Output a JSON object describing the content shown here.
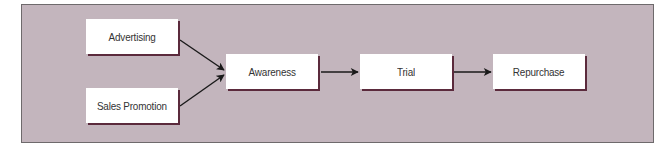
{
  "diagram": {
    "type": "flowchart",
    "direction": "left-to-right",
    "colors": {
      "panel_background": "#c3b5bd",
      "panel_border": "#6e6a6c",
      "node_fill": "#ffffff",
      "node_shadow": "#5b2a3c",
      "arrow": "#1a1a1a",
      "text": "#333333"
    },
    "nodes": [
      {
        "id": "advertising",
        "label": "Advertising"
      },
      {
        "id": "sales_promotion",
        "label": "Sales Promotion"
      },
      {
        "id": "awareness",
        "label": "Awareness"
      },
      {
        "id": "trial",
        "label": "Trial"
      },
      {
        "id": "repurchase",
        "label": "Repurchase"
      }
    ],
    "edges": [
      {
        "from": "advertising",
        "to": "awareness"
      },
      {
        "from": "sales_promotion",
        "to": "awareness"
      },
      {
        "from": "awareness",
        "to": "trial"
      },
      {
        "from": "trial",
        "to": "repurchase"
      }
    ]
  }
}
